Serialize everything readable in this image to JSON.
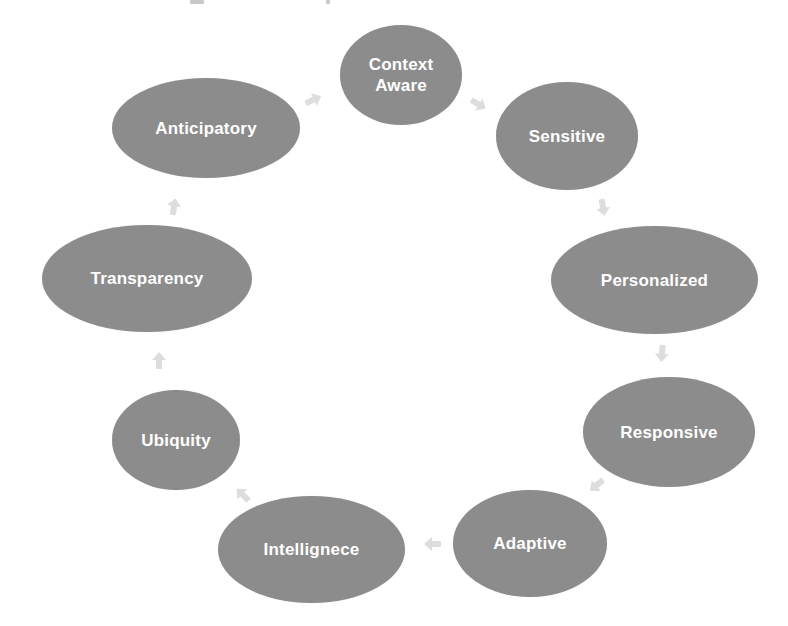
{
  "diagram": {
    "type": "cycle",
    "node_color": "#8c8c8c",
    "text_color": "#ffffff",
    "arrow_color": "#d9d9d9",
    "nodes": [
      {
        "id": "context-aware",
        "label": "Context\nAware",
        "x": 340,
        "y": 25,
        "w": 122,
        "h": 100
      },
      {
        "id": "sensitive",
        "label": "Sensitive",
        "x": 496,
        "y": 82,
        "w": 142,
        "h": 108
      },
      {
        "id": "personalized",
        "label": "Personalized",
        "x": 551,
        "y": 226,
        "w": 207,
        "h": 108
      },
      {
        "id": "responsive",
        "label": "Responsive",
        "x": 583,
        "y": 377,
        "w": 172,
        "h": 110
      },
      {
        "id": "adaptive",
        "label": "Adaptive",
        "x": 453,
        "y": 490,
        "w": 154,
        "h": 107
      },
      {
        "id": "intellignece",
        "label": "Intellignece",
        "x": 218,
        "y": 496,
        "w": 187,
        "h": 107
      },
      {
        "id": "ubiquity",
        "label": "Ubiquity",
        "x": 112,
        "y": 390,
        "w": 128,
        "h": 100
      },
      {
        "id": "transparency",
        "label": "Transparency",
        "x": 42,
        "y": 225,
        "w": 210,
        "h": 107
      },
      {
        "id": "anticipatory",
        "label": "Anticipatory",
        "x": 112,
        "y": 78,
        "w": 188,
        "h": 100
      }
    ],
    "arrows": [
      {
        "from": "context-aware",
        "to": "sensitive",
        "x": 467,
        "y": 93,
        "rot": 30
      },
      {
        "from": "sensitive",
        "to": "personalized",
        "x": 592,
        "y": 196,
        "rot": 80
      },
      {
        "from": "personalized",
        "to": "responsive",
        "x": 651,
        "y": 342,
        "rot": 95
      },
      {
        "from": "responsive",
        "to": "adaptive",
        "x": 586,
        "y": 474,
        "rot": 140
      },
      {
        "from": "adaptive",
        "to": "intellignece",
        "x": 422,
        "y": 533,
        "rot": 180
      },
      {
        "from": "intellignece",
        "to": "ubiquity",
        "x": 232,
        "y": 484,
        "rot": 225
      },
      {
        "from": "ubiquity",
        "to": "transparency",
        "x": 148,
        "y": 350,
        "rot": 270
      },
      {
        "from": "transparency",
        "to": "anticipatory",
        "x": 163,
        "y": 196,
        "rot": 280
      },
      {
        "from": "anticipatory",
        "to": "context-aware",
        "x": 302,
        "y": 89,
        "rot": 335
      }
    ]
  }
}
